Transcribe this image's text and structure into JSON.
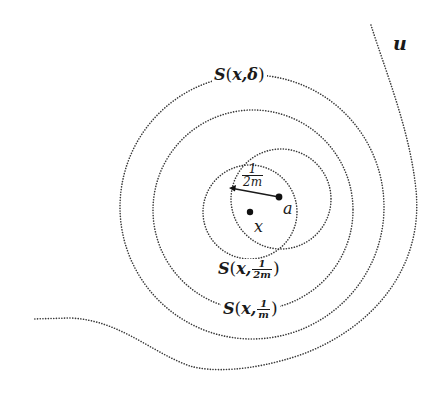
{
  "diagram": {
    "type": "concentric-balls-illustration",
    "points": {
      "x": {
        "label": "x",
        "cx": 250,
        "cy": 212
      },
      "a": {
        "label": "a",
        "cx": 279,
        "cy": 197
      }
    },
    "circles": [
      {
        "id": "S_delta",
        "cx": 252,
        "cy": 207,
        "r": 132,
        "label": "S(x, δ)"
      },
      {
        "id": "S_1_over_m",
        "cx": 253,
        "cy": 210,
        "r": 100,
        "label": "S(x, 1/m)"
      },
      {
        "id": "S_1_over_2m",
        "cx": 250,
        "cy": 212,
        "r": 47,
        "label": "S(x, 1/2m)"
      },
      {
        "id": "ball_a",
        "cx": 281,
        "cy": 199,
        "r": 50,
        "label": ""
      }
    ],
    "radius_arrow": {
      "from": [
        279,
        197
      ],
      "to": [
        230,
        188
      ],
      "label_num": "1",
      "label_den": "2m"
    },
    "curve_u": {
      "label": "u"
    }
  },
  "labels": {
    "s_delta": {
      "prefix": "S",
      "open": "(",
      "var": "x",
      "sep": ",",
      "arg": "δ",
      "close": ")"
    },
    "s_1m": {
      "prefix": "S",
      "open": "(",
      "var": "x",
      "sep": ",",
      "num": "1",
      "den": "m",
      "close": ")"
    },
    "s_12m": {
      "prefix": "S",
      "open": "(",
      "var": "x",
      "sep": ",",
      "num": "1",
      "den": "2m",
      "close": ")"
    },
    "radius": {
      "num": "1",
      "den": "2m"
    },
    "point_x": "x",
    "point_a": "a",
    "curve_u": "u"
  },
  "colors": {
    "ink": "#1a1a1a",
    "dotted": "#3a3a3a",
    "background": "#ffffff"
  }
}
